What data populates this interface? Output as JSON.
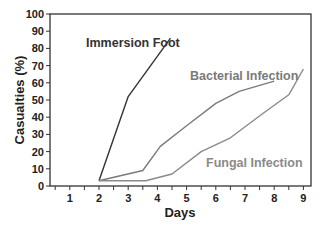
{
  "chart_data": {
    "type": "line",
    "title": "",
    "xlabel": "Days",
    "ylabel": "Casualties (%)",
    "xlim": [
      0.35,
      9.3
    ],
    "ylim": [
      0,
      100
    ],
    "x_ticks": [
      1,
      2,
      3,
      4,
      5,
      6,
      7,
      8,
      9
    ],
    "y_ticks": [
      0,
      10,
      20,
      30,
      40,
      50,
      60,
      70,
      80,
      90,
      100
    ],
    "grid": false,
    "legend": "inline labels",
    "series": [
      {
        "name": "Immersion Foot",
        "color": "#333333",
        "label_color": "#333333",
        "points": [
          [
            2,
            3
          ],
          [
            3,
            52
          ],
          [
            4.45,
            86
          ]
        ]
      },
      {
        "name": "Bacterial Infection",
        "color": "#7a7a7a",
        "label_color": "#7a7a7a",
        "points": [
          [
            2,
            3
          ],
          [
            3.5,
            9
          ],
          [
            4.1,
            23
          ],
          [
            5,
            35
          ],
          [
            6,
            48
          ],
          [
            6.8,
            55
          ],
          [
            8,
            61
          ]
        ]
      },
      {
        "name": "Fungal Infection",
        "color": "#8a8a8a",
        "label_color": "#8a8a8a",
        "points": [
          [
            2,
            3
          ],
          [
            3.6,
            3
          ],
          [
            4.5,
            7
          ],
          [
            5.5,
            20
          ],
          [
            6.5,
            28
          ],
          [
            7.6,
            42
          ],
          [
            8.5,
            53
          ],
          [
            9,
            68
          ]
        ]
      }
    ],
    "labels": [
      {
        "series": "Immersion Foot",
        "text": "Immersion Foot",
        "x": 86,
        "y": 47
      },
      {
        "series": "Bacterial Infection",
        "text": "Bacterial Infection",
        "x": 190,
        "y": 80
      },
      {
        "series": "Fungal Infection",
        "text": "Fungal Infection",
        "x": 206,
        "y": 167
      }
    ]
  }
}
